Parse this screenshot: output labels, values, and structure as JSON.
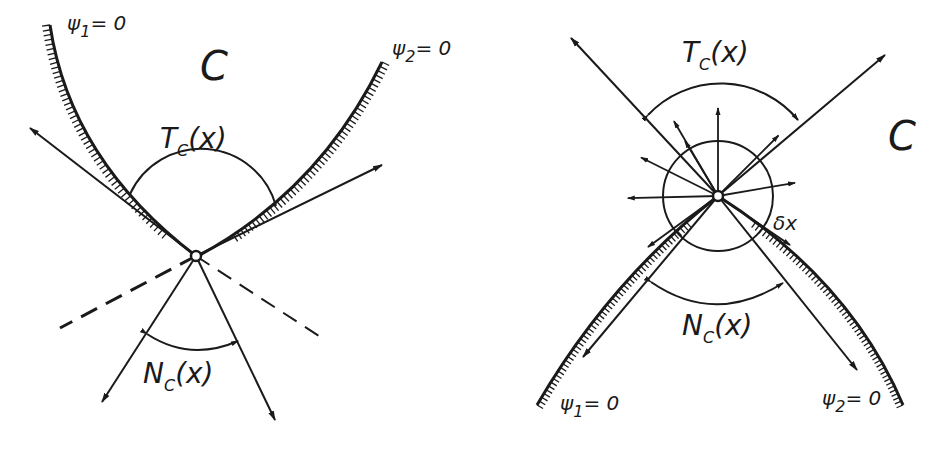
{
  "left_panel": {
    "set_label": "C",
    "psi1": {
      "name": "ψ",
      "sub": "1",
      "rhs": "= 0"
    },
    "psi2": {
      "name": "ψ",
      "sub": "2",
      "rhs": "= 0"
    },
    "tangent_cone": {
      "main": "T",
      "sub": "C",
      "arg": "(x)"
    },
    "normal_cone": {
      "main": "N",
      "sub": "C",
      "arg": "(x)"
    }
  },
  "right_panel": {
    "set_label": "C",
    "psi1": {
      "name": "ψ",
      "sub": "1",
      "rhs": "= 0"
    },
    "psi2": {
      "name": "ψ",
      "sub": "2",
      "rhs": "= 0"
    },
    "tangent_cone": {
      "main": "T",
      "sub": "C",
      "arg": "(x)"
    },
    "normal_cone": {
      "main": "N",
      "sub": "C",
      "arg": "(x)"
    },
    "ball_label": "δx"
  },
  "colors": {
    "ink": "#1a1a1a",
    "paper": "#ffffff"
  }
}
